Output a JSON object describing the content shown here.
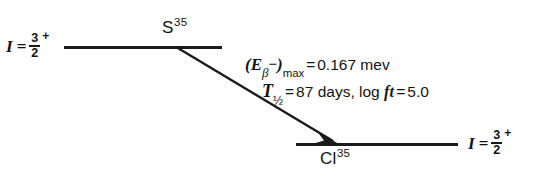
{
  "diagram": {
    "background_color": "#ffffff",
    "line_color": "#1a1a1a"
  },
  "levels": {
    "upper": {
      "nuclide_symbol": "S",
      "nuclide_mass_number": "35",
      "spin_label_I": "I",
      "spin_equals": "=",
      "spin_numerator": "3",
      "spin_denominator": "2",
      "parity": "+"
    },
    "lower": {
      "nuclide_symbol": "Cl",
      "nuclide_mass_number": "35",
      "spin_label_I": "I",
      "spin_equals": "=",
      "spin_numerator": "3",
      "spin_denominator": "2",
      "parity": "+"
    }
  },
  "transition": {
    "arrow_type": "beta-minus-decay-arrow",
    "energy": {
      "open_paren": "(",
      "symbol_E": "E",
      "subscript_beta": "β",
      "charge_sign": "−",
      "close_paren": ")",
      "subscript_max": "max",
      "equals": "=",
      "value": "0.167",
      "unit": "mev"
    },
    "halflife": {
      "symbol_T": "T",
      "subscript": "½",
      "equals": "=",
      "value": "87",
      "unit": "days",
      "separator": ","
    },
    "logft": {
      "log_word": "log",
      "symbol_ft": "ft",
      "equals": "=",
      "value": "5.0"
    }
  }
}
